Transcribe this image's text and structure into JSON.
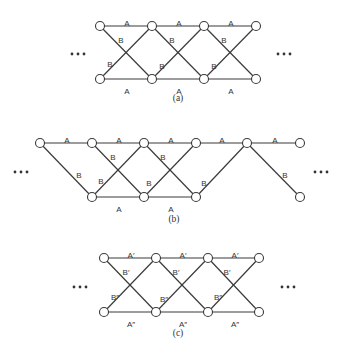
{
  "panels": [
    {
      "id": "a",
      "caption": "(a)",
      "node_radius": 4.5,
      "nodes": [
        {
          "id": "t1",
          "x": 100,
          "y": 26
        },
        {
          "id": "t2",
          "x": 152,
          "y": 26
        },
        {
          "id": "t3",
          "x": 204,
          "y": 26
        },
        {
          "id": "t4",
          "x": 256,
          "y": 26
        },
        {
          "id": "b1",
          "x": 100,
          "y": 79
        },
        {
          "id": "b2",
          "x": 152,
          "y": 79
        },
        {
          "id": "b3",
          "x": 204,
          "y": 79
        },
        {
          "id": "b4",
          "x": 256,
          "y": 79
        }
      ],
      "edges": [
        {
          "from": "t1",
          "to": "t2",
          "label": "A",
          "lx": 127,
          "ly": 23
        },
        {
          "from": "t2",
          "to": "t3",
          "label": "A",
          "lx": 179,
          "ly": 23
        },
        {
          "from": "t3",
          "to": "t4",
          "label": "A",
          "lx": 231,
          "ly": 23
        },
        {
          "from": "b1",
          "to": "b2",
          "label": "A",
          "lx": 127,
          "ly": 91
        },
        {
          "from": "b2",
          "to": "b3",
          "label": "A",
          "lx": 179,
          "ly": 91
        },
        {
          "from": "b3",
          "to": "b4",
          "label": "A",
          "lx": 231,
          "ly": 91
        },
        {
          "from": "t1",
          "to": "b2",
          "label": "B",
          "lx": 121,
          "ly": 40
        },
        {
          "from": "t2",
          "to": "b3",
          "label": "B",
          "lx": 172,
          "ly": 40
        },
        {
          "from": "t3",
          "to": "b4",
          "label": "B",
          "lx": 224,
          "ly": 40
        },
        {
          "from": "b1",
          "to": "t2",
          "label": "B",
          "lx": 110,
          "ly": 64
        },
        {
          "from": "b2",
          "to": "t3",
          "label": "B",
          "lx": 162,
          "ly": 66
        },
        {
          "from": "b3",
          "to": "t4",
          "label": "B",
          "lx": 214,
          "ly": 66
        }
      ],
      "ellipsis": [
        {
          "x": 78,
          "y": 54
        },
        {
          "x": 284,
          "y": 54
        }
      ],
      "caption_pos": {
        "x": 178,
        "y": 101
      }
    },
    {
      "id": "b",
      "caption": "(b)",
      "node_radius": 4.5,
      "nodes": [
        {
          "id": "t1",
          "x": 40,
          "y": 143
        },
        {
          "id": "t2",
          "x": 92,
          "y": 143
        },
        {
          "id": "t3",
          "x": 144,
          "y": 143
        },
        {
          "id": "t4",
          "x": 196,
          "y": 143
        },
        {
          "id": "t5",
          "x": 247,
          "y": 143
        },
        {
          "id": "t6",
          "x": 300,
          "y": 143
        },
        {
          "id": "b2",
          "x": 92,
          "y": 197
        },
        {
          "id": "b3",
          "x": 144,
          "y": 197
        },
        {
          "id": "b4",
          "x": 196,
          "y": 197
        },
        {
          "id": "b6",
          "x": 300,
          "y": 197
        }
      ],
      "edges": [
        {
          "from": "t1",
          "to": "t2",
          "label": "A",
          "lx": 67,
          "ly": 140
        },
        {
          "from": "t2",
          "to": "t3",
          "label": "A",
          "lx": 119,
          "ly": 140
        },
        {
          "from": "t3",
          "to": "t4",
          "label": "A",
          "lx": 171,
          "ly": 140
        },
        {
          "from": "t4",
          "to": "t5",
          "label": "A",
          "lx": 222,
          "ly": 140
        },
        {
          "from": "t5",
          "to": "t6",
          "label": "A",
          "lx": 275,
          "ly": 140
        },
        {
          "from": "b2",
          "to": "b3",
          "label": "A",
          "lx": 119,
          "ly": 209
        },
        {
          "from": "b3",
          "to": "b4",
          "label": "A",
          "lx": 171,
          "ly": 209
        },
        {
          "from": "t1",
          "to": "b2",
          "label": "B",
          "lx": 79,
          "ly": 175
        },
        {
          "from": "t2",
          "to": "b3",
          "label": "B",
          "lx": 113,
          "ly": 157
        },
        {
          "from": "t3",
          "to": "b4",
          "label": "B",
          "lx": 163,
          "ly": 157
        },
        {
          "from": "b2",
          "to": "t3",
          "label": "B",
          "lx": 101,
          "ly": 181
        },
        {
          "from": "b3",
          "to": "t4",
          "label": "B",
          "lx": 149,
          "ly": 183
        },
        {
          "from": "b4",
          "to": "t5",
          "label": "B",
          "lx": 204,
          "ly": 183
        },
        {
          "from": "t5",
          "to": "b6",
          "label": "B",
          "lx": 285,
          "ly": 175
        }
      ],
      "ellipsis": [
        {
          "x": 21,
          "y": 172
        },
        {
          "x": 321,
          "y": 172
        }
      ],
      "caption_pos": {
        "x": 174,
        "y": 222
      }
    },
    {
      "id": "c",
      "caption": "(c)",
      "node_radius": 4.5,
      "nodes": [
        {
          "id": "t1",
          "x": 104,
          "y": 258
        },
        {
          "id": "t2",
          "x": 156,
          "y": 258
        },
        {
          "id": "t3",
          "x": 208,
          "y": 258
        },
        {
          "id": "t4",
          "x": 259,
          "y": 258
        },
        {
          "id": "b1",
          "x": 104,
          "y": 312
        },
        {
          "id": "b2",
          "x": 156,
          "y": 312
        },
        {
          "id": "b3",
          "x": 208,
          "y": 312
        },
        {
          "id": "b4",
          "x": 259,
          "y": 312
        }
      ],
      "edges": [
        {
          "from": "t1",
          "to": "t2",
          "label": "A′",
          "lx": 131,
          "ly": 255
        },
        {
          "from": "t2",
          "to": "t3",
          "label": "A′",
          "lx": 183,
          "ly": 255
        },
        {
          "from": "t3",
          "to": "t4",
          "label": "A′",
          "lx": 235,
          "ly": 255
        },
        {
          "from": "b1",
          "to": "b2",
          "label": "A″",
          "lx": 131,
          "ly": 324
        },
        {
          "from": "b2",
          "to": "b3",
          "label": "A″",
          "lx": 183,
          "ly": 324
        },
        {
          "from": "b3",
          "to": "b4",
          "label": "A″",
          "lx": 235,
          "ly": 324
        },
        {
          "from": "t1",
          "to": "b2",
          "label": "B′",
          "lx": 126,
          "ly": 272
        },
        {
          "from": "t2",
          "to": "b3",
          "label": "B′",
          "lx": 176,
          "ly": 272
        },
        {
          "from": "t3",
          "to": "b4",
          "label": "B′",
          "lx": 227,
          "ly": 272
        },
        {
          "from": "b1",
          "to": "t2",
          "label": "B″",
          "lx": 115,
          "ly": 297
        },
        {
          "from": "b2",
          "to": "t3",
          "label": "B″",
          "lx": 164,
          "ly": 299
        },
        {
          "from": "b3",
          "to": "t4",
          "label": "B″",
          "lx": 218,
          "ly": 297
        }
      ],
      "ellipsis": [
        {
          "x": 80,
          "y": 287
        },
        {
          "x": 288,
          "y": 287
        }
      ],
      "caption_pos": {
        "x": 178,
        "y": 336
      }
    }
  ]
}
